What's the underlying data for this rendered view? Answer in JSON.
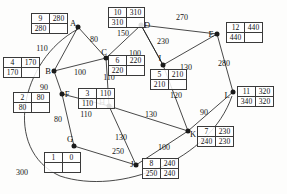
{
  "diagram": {
    "type": "weighted-graph",
    "ink_color": "#1a1a1a",
    "box_border_color": "#3a3a3a",
    "nodes": [
      {
        "id": "A",
        "label": "A",
        "x": 78,
        "y": 27,
        "label_dx": -5,
        "label_dy": -4,
        "box": {
          "x": 31,
          "y": 13,
          "rows": [
            [
              "9",
              "280"
            ],
            [
              "280",
              ""
            ]
          ]
        }
      },
      {
        "id": "B",
        "label": "B",
        "x": 54,
        "y": 71,
        "label_dx": -6,
        "label_dy": 0,
        "box": {
          "x": 3,
          "y": 57,
          "rows": [
            [
              "4",
              "170"
            ],
            [
              "170",
              ""
            ]
          ]
        }
      },
      {
        "id": "C",
        "label": "C",
        "x": 106,
        "y": 58,
        "label_dx": -2,
        "label_dy": -6,
        "box": {
          "x": 108,
          "y": 55,
          "rows": [
            [
              "6",
              "220"
            ],
            [
              "220",
              ""
            ]
          ]
        }
      },
      {
        "id": "D",
        "label": "D",
        "x": 141,
        "y": 25,
        "label_dx": 6,
        "label_dy": 0,
        "box": {
          "x": 108,
          "y": 7,
          "rows": [
            [
              "10",
              "310"
            ],
            [
              "310",
              ""
            ]
          ]
        }
      },
      {
        "id": "E",
        "label": "E",
        "x": 217,
        "y": 34,
        "label_dx": -6,
        "label_dy": 0,
        "box": {
          "x": 226,
          "y": 22,
          "rows": [
            [
              "12",
              "440"
            ],
            [
              "440",
              ""
            ]
          ]
        }
      },
      {
        "id": "F",
        "label": "F",
        "x": 62,
        "y": 94,
        "label_dx": 5,
        "label_dy": 0,
        "box": {
          "x": 13,
          "y": 92,
          "rows": [
            [
              "2",
              "80"
            ],
            [
              "80",
              ""
            ]
          ]
        }
      },
      {
        "id": "G",
        "label": "G",
        "x": 74,
        "y": 146,
        "label_dx": -4,
        "label_dy": -7,
        "box": {
          "x": 44,
          "y": 152,
          "rows": [
            [
              "1",
              "0"
            ],
            [
              "",
              ""
            ]
          ]
        }
      },
      {
        "id": "H",
        "label": "H",
        "x": 109,
        "y": 106,
        "label_dx": -7,
        "label_dy": -4,
        "box": {
          "x": 78,
          "y": 88,
          "rows": [
            [
              "3",
              "110"
            ],
            [
              "110",
              ""
            ]
          ]
        }
      },
      {
        "id": "I",
        "label": "I",
        "x": 163,
        "y": 65,
        "label_dx": -3,
        "label_dy": -7,
        "box": {
          "x": 150,
          "y": 69,
          "rows": [
            [
              "5",
              "210"
            ],
            [
              "210",
              ""
            ]
          ]
        }
      },
      {
        "id": "J",
        "label": "J",
        "x": 136,
        "y": 165,
        "label_dx": -4,
        "label_dy": -1,
        "box": {
          "x": 142,
          "y": 158,
          "rows": [
            [
              "8",
              "240"
            ],
            [
              "250",
              "240"
            ]
          ]
        }
      },
      {
        "id": "K",
        "label": "K",
        "x": 188,
        "y": 131,
        "label_dx": 5,
        "label_dy": 3,
        "box": {
          "x": 197,
          "y": 126,
          "rows": [
            [
              "7",
              "230"
            ],
            [
              "240",
              "230"
            ]
          ]
        }
      },
      {
        "id": "L",
        "label": "L",
        "x": 233,
        "y": 92,
        "label_dx": -6,
        "label_dy": 3,
        "box": {
          "x": 237,
          "y": 86,
          "rows": [
            [
              "11",
              "320"
            ],
            [
              "340",
              "320"
            ]
          ]
        }
      }
    ],
    "edges": [
      {
        "from": "A",
        "to": "B",
        "weight": "110",
        "lx": 42,
        "ly": 49
      },
      {
        "from": "A",
        "to": "C",
        "weight": "80",
        "lx": 94,
        "ly": 40
      },
      {
        "from": "B",
        "to": "C",
        "weight": "100",
        "lx": 80,
        "ly": 73
      },
      {
        "from": "C",
        "to": "D",
        "weight": "150",
        "lx": 123,
        "ly": 34
      },
      {
        "from": "D",
        "to": "E",
        "weight": "270",
        "lx": 182,
        "ly": 18
      },
      {
        "from": "D",
        "to": "I",
        "weight": "100",
        "lx": 135,
        "ly": 54
      },
      {
        "from": "I",
        "to": "D",
        "weight": "230",
        "lx": 163,
        "ly": 42
      },
      {
        "from": "E",
        "to": "L",
        "weight": "280",
        "lx": 224,
        "ly": 64
      },
      {
        "from": "B",
        "to": "F",
        "weight": "90",
        "lx": 44,
        "ly": 88
      },
      {
        "from": "F",
        "to": "G",
        "weight": "80",
        "lx": 58,
        "ly": 120
      },
      {
        "from": "F",
        "to": "H",
        "weight": "110",
        "lx": 86,
        "ly": 115
      },
      {
        "from": "C",
        "to": "H",
        "weight": "110",
        "lx": 109,
        "ly": 78
      },
      {
        "from": "H",
        "to": "J",
        "weight": "130",
        "lx": 121,
        "ly": 138
      },
      {
        "from": "I",
        "to": "K",
        "weight": "120",
        "lx": 176,
        "ly": 96
      },
      {
        "from": "H",
        "to": "K",
        "weight": "130",
        "lx": 151,
        "ly": 115
      },
      {
        "from": "I",
        "to": "E",
        "weight": "130",
        "lx": 186,
        "ly": 68
      },
      {
        "from": "J",
        "to": "K",
        "weight": "100",
        "lx": 164,
        "ly": 148
      },
      {
        "from": "K",
        "to": "L",
        "weight": "90",
        "lx": 204,
        "ly": 113
      },
      {
        "from": "G",
        "to": "J",
        "weight": "250",
        "lx": 118,
        "ly": 152
      },
      {
        "from": "G",
        "to": "A",
        "weight": "300",
        "lx": 22,
        "ly": 173
      }
    ]
  }
}
